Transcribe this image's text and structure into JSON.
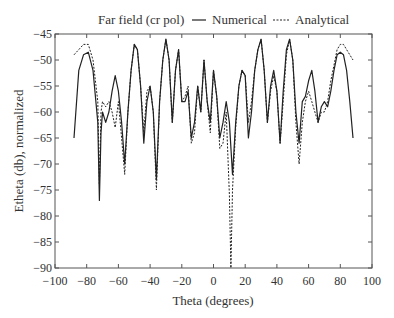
{
  "chart_data": {
    "type": "line",
    "title": "Far field (cr pol)",
    "xlabel": "Theta (degrees)",
    "ylabel": "Etheta (db), normalized",
    "xlim": [
      -100,
      100
    ],
    "ylim": [
      -90,
      -45
    ],
    "xticks": [
      -100,
      -80,
      -60,
      -40,
      -20,
      0,
      20,
      40,
      60,
      80,
      100
    ],
    "yticks": [
      -45,
      -50,
      -55,
      -60,
      -65,
      -70,
      -75,
      -80,
      -85,
      -90
    ],
    "grid": false,
    "legend_position": "top",
    "series": [
      {
        "name": "Numerical",
        "style": "solid",
        "x": [
          -88,
          -85,
          -82,
          -79,
          -76,
          -73,
          -72,
          -71,
          -70,
          -68,
          -66,
          -64,
          -62,
          -60,
          -58,
          -56,
          -54,
          -52,
          -50,
          -48,
          -46,
          -44,
          -42,
          -40,
          -38,
          -36,
          -34,
          -32,
          -30,
          -28,
          -26,
          -24,
          -22,
          -20,
          -18,
          -16,
          -14,
          -12,
          -10,
          -8,
          -6,
          -4,
          -2,
          0,
          2,
          4,
          6,
          8,
          10,
          12,
          14,
          16,
          18,
          20,
          22,
          24,
          26,
          28,
          30,
          32,
          34,
          36,
          38,
          40,
          42,
          44,
          46,
          48,
          50,
          52,
          54,
          56,
          58,
          60,
          62,
          64,
          66,
          68,
          70,
          72,
          74,
          76,
          78,
          80,
          82,
          84,
          86,
          88
        ],
        "y": [
          -65,
          -52,
          -49,
          -48.5,
          -52,
          -62,
          -77,
          -64,
          -60,
          -62,
          -60,
          -56,
          -53,
          -56,
          -62,
          -70,
          -60,
          -52,
          -47,
          -48,
          -55,
          -66,
          -58,
          -55,
          -60,
          -73,
          -58,
          -50,
          -46,
          -50,
          -62,
          -52,
          -48,
          -58,
          -58,
          -56,
          -65,
          -62,
          -55,
          -60,
          -50,
          -58,
          -62,
          -52,
          -57,
          -65,
          -62,
          -58,
          -62,
          -72,
          -62,
          -55,
          -52,
          -53,
          -65,
          -60,
          -52,
          -48,
          -46,
          -52,
          -62,
          -55,
          -52,
          -56,
          -66,
          -56,
          -48,
          -46,
          -50,
          -60,
          -66,
          -58,
          -57,
          -54,
          -52,
          -56,
          -62,
          -59,
          -58,
          -59,
          -56,
          -52,
          -49,
          -48.5,
          -49,
          -52,
          -58,
          -65
        ]
      },
      {
        "name": "Analytical",
        "style": "dashed",
        "x": [
          -88,
          -85,
          -82,
          -79,
          -76,
          -73,
          -72,
          -71,
          -70,
          -68,
          -66,
          -64,
          -62,
          -60,
          -58,
          -56,
          -54,
          -52,
          -50,
          -48,
          -46,
          -44,
          -42,
          -40,
          -38,
          -36,
          -34,
          -32,
          -30,
          -28,
          -26,
          -24,
          -22,
          -20,
          -18,
          -16,
          -14,
          -12,
          -10,
          -8,
          -6,
          -4,
          -2,
          0,
          2,
          4,
          6,
          8,
          10,
          11,
          12,
          14,
          16,
          18,
          20,
          22,
          24,
          26,
          28,
          30,
          32,
          34,
          36,
          38,
          40,
          42,
          44,
          46,
          48,
          50,
          52,
          54,
          56,
          58,
          60,
          62,
          64,
          66,
          68,
          70,
          72,
          74,
          76,
          78,
          80,
          82,
          84,
          86,
          88
        ],
        "y": [
          -49,
          -48,
          -47,
          -47,
          -50,
          -58,
          -74,
          -60,
          -58,
          -59,
          -58,
          -60,
          -63,
          -58,
          -65,
          -72,
          -60,
          -52,
          -47,
          -48,
          -55,
          -64,
          -56,
          -55,
          -60,
          -75,
          -58,
          -50,
          -46,
          -50,
          -62,
          -52,
          -48,
          -58,
          -57,
          -55,
          -66,
          -64,
          -55,
          -60,
          -50,
          -58,
          -64,
          -52,
          -57,
          -67,
          -66,
          -60,
          -76,
          -90,
          -75,
          -63,
          -55,
          -52,
          -53,
          -62,
          -58,
          -52,
          -48,
          -46,
          -52,
          -62,
          -56,
          -53,
          -56,
          -66,
          -58,
          -49,
          -46,
          -50,
          -62,
          -70,
          -62,
          -58,
          -56,
          -58,
          -60,
          -62,
          -60,
          -60,
          -58,
          -54,
          -51,
          -48,
          -47,
          -47,
          -48,
          -49,
          -50
        ]
      }
    ]
  },
  "labels": {
    "title": "Far field (cr pol)",
    "legend_numerical": "Numerical",
    "legend_analytical": "Analytical",
    "xlabel": "Theta (degrees)",
    "ylabel": "Etheta (db), normalized"
  }
}
